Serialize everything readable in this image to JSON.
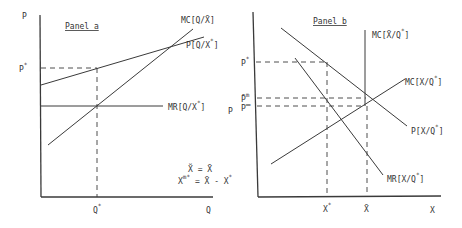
{
  "panel_a": {
    "title": "Panel a",
    "y_axis_label": "P",
    "x_axis_label": "Q",
    "p_star": "P",
    "p_star_sup": "*",
    "q_star": "Q",
    "q_star_sup": "*",
    "curves": {
      "mc": "MC[Q/X̄]",
      "price": "P[Q/X",
      "price_sup": "*",
      "price_end": "]",
      "mr": "MR[Q/X",
      "mr_sup": "*",
      "mr_end": "]"
    },
    "equations": {
      "eq1": "X̆ = X̄",
      "eq2_left": "X",
      "eq2_sup": "m*",
      "eq2_right": " = X̄ - X",
      "eq2_sup2": "*"
    }
  },
  "panel_b": {
    "title": "Panel b",
    "y_axis_label": "P",
    "x_axis_label": "X",
    "p_star": "P",
    "p_star_sup": "*",
    "p_bar_m": "P̄",
    "p_bar_m_sup": "m",
    "p_dbar": "P̿",
    "x_star": "X",
    "x_star_sup": "*",
    "x_bar": "X̄",
    "curves": {
      "mc_vertical": "MC[X̄/Q",
      "mc_vertical_sup": "*",
      "mc_vertical_end": "]",
      "mc": "MC[X/Q",
      "mc_sup": "*",
      "mc_end": "]",
      "price": "P[X/Q",
      "price_sup": "*",
      "price_end": "]",
      "mr": "MR[X/Q",
      "mr_sup": "*",
      "mr_end": "]"
    }
  }
}
